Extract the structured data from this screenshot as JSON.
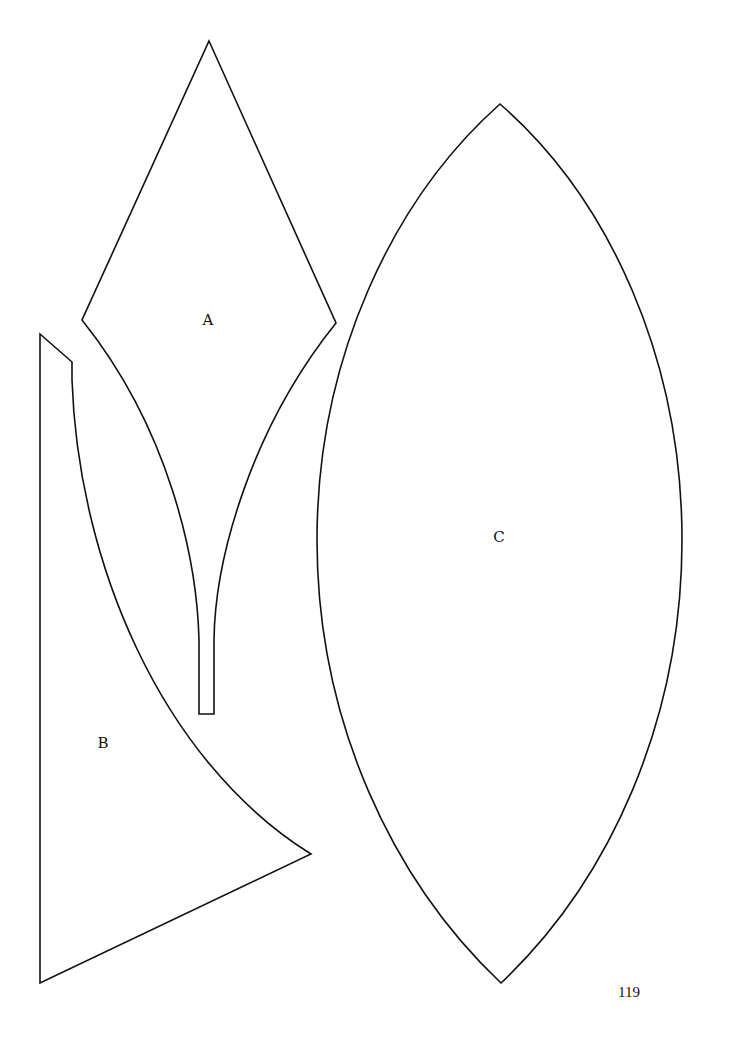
{
  "page": {
    "number": "119",
    "background": "#ffffff",
    "stroke_color": "#111111"
  },
  "pieces": [
    {
      "id": "A",
      "label": "A",
      "description": "Kite-shaped pattern piece tapering into a narrow curved stem"
    },
    {
      "id": "B",
      "label": "B",
      "description": "Tall triangular pattern piece with a concave curved edge and a small notch at top"
    },
    {
      "id": "C",
      "label": "C",
      "description": "Pointed-oval (vesica / lens) pattern piece"
    }
  ]
}
